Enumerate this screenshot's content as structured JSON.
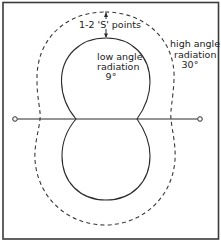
{
  "diagram": {
    "labels": {
      "s_points": "1-2  'S' points",
      "low_angle_line1": "low angle",
      "low_angle_line2": "radiation",
      "low_angle_value": "9°",
      "high_angle_line1": "high angle",
      "high_angle_line2": "radiation",
      "high_angle_value": "30°"
    },
    "elements": {
      "dipole": "horizontal antenna element with end insulators",
      "low_angle_pattern": "solid figure-eight lobe (low angle radiation)",
      "high_angle_pattern": "dashed figure-eight lobe (high angle radiation)",
      "dimension_arrow": "double-headed arrow indicating 1-2 S points difference"
    },
    "colors": {
      "ink": "#2a2a2a",
      "frame": "#3a3a3a",
      "background": "#ffffff"
    }
  }
}
